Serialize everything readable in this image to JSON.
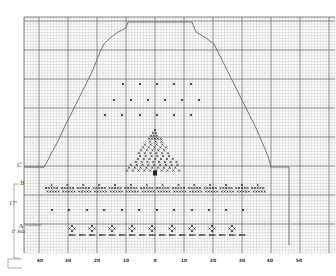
{
  "chart_data": {
    "type": "knitting-chart",
    "title": "",
    "x_axis": {
      "tick_labels": [
        "40",
        "30",
        "20",
        "10",
        "0",
        "10",
        "20",
        "30",
        "40",
        "50"
      ],
      "tick_px": [
        40,
        68,
        97,
        126,
        155,
        184,
        213,
        242,
        270,
        299
      ]
    },
    "grid": {
      "left": 24,
      "top": 17,
      "right": 335,
      "bottom": 253,
      "cell": 2.9,
      "major_every": 10
    },
    "side_labels": {
      "C": "C",
      "B": "B",
      "measure": "17\"",
      "A": "A",
      "a_note": "(stitches)",
      "rib": "1\" Rib"
    },
    "outline": {
      "description": "Stepped trapezoid shaping: base at row C, decreases up to a flat top",
      "points": [
        [
          24,
          167
        ],
        [
          44,
          167
        ],
        [
          48,
          160
        ],
        [
          52,
          152
        ],
        [
          56,
          145
        ],
        [
          60,
          137
        ],
        [
          64,
          128
        ],
        [
          68,
          120
        ],
        [
          72,
          112
        ],
        [
          76,
          104
        ],
        [
          80,
          96
        ],
        [
          84,
          88
        ],
        [
          88,
          80
        ],
        [
          92,
          72
        ],
        [
          96,
          62
        ],
        [
          100,
          52
        ],
        [
          104,
          44
        ],
        [
          110,
          38
        ],
        [
          118,
          32
        ],
        [
          126,
          28
        ],
        [
          128,
          22
        ],
        [
          192,
          22
        ],
        [
          196,
          32
        ],
        [
          206,
          38
        ],
        [
          214,
          44
        ],
        [
          220,
          56
        ],
        [
          226,
          68
        ],
        [
          232,
          80
        ],
        [
          238,
          92
        ],
        [
          244,
          104
        ],
        [
          250,
          116
        ],
        [
          256,
          128
        ],
        [
          262,
          142
        ],
        [
          268,
          156
        ],
        [
          271,
          167
        ],
        [
          289,
          167
        ],
        [
          289,
          245
        ]
      ]
    },
    "motifs": {
      "scatter_rows": [
        {
          "y": 84,
          "x": [
            123,
            140,
            157,
            174,
            191
          ]
        },
        {
          "y": 100,
          "x": [
            114,
            131,
            148,
            165,
            182,
            199
          ]
        },
        {
          "y": 115,
          "x": [
            105,
            122,
            140,
            157,
            174,
            191
          ]
        }
      ],
      "tree": {
        "cx": 155,
        "top": 130,
        "bottom": 170,
        "half_width": 28
      },
      "band_B": {
        "y": 190,
        "x_start": 46,
        "x_end": 268,
        "repeat": 14
      },
      "dot_row": {
        "y": 210,
        "x": [
          52,
          69,
          87,
          104,
          122,
          139,
          157,
          174,
          192,
          209,
          226,
          243
        ]
      },
      "band_rib": {
        "y": 230,
        "x_start": 72,
        "x_end": 242,
        "repeat": 17
      }
    }
  }
}
